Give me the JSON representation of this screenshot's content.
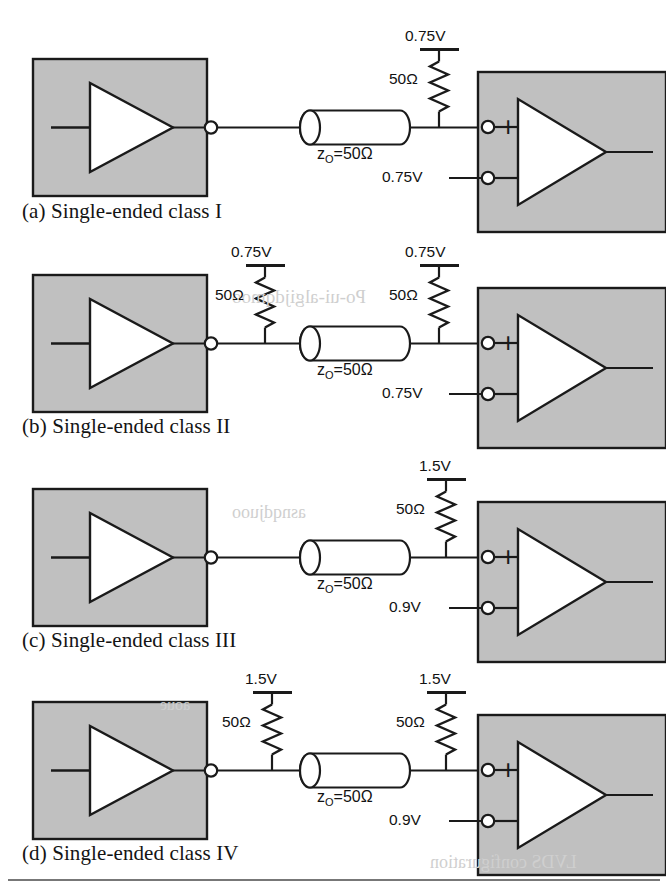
{
  "figure": {
    "title_alt": "Single-ended signaling classes I through IV",
    "colors": {
      "chip_fill": "#c0c0c0",
      "line": "#1a1a1a",
      "white": "#ffffff",
      "rule": "#4a4a4a"
    }
  },
  "common": {
    "line_impedance": "z",
    "line_impedance_sub": "O",
    "line_impedance_value": "=50Ω",
    "resistor_value": "50Ω",
    "plus_sign": "+",
    "minus_sign": "−"
  },
  "rows": [
    {
      "id": "a",
      "caption": "(a) Single-ended class I",
      "source_termination": null,
      "far_termination": {
        "supply": "0.75V",
        "resistor": "50Ω"
      },
      "reference_voltage": "0.75V",
      "line_label": "=50Ω"
    },
    {
      "id": "b",
      "caption": "(b) Single-ended class II",
      "source_termination": {
        "supply": "0.75V",
        "resistor": "50Ω"
      },
      "far_termination": {
        "supply": "0.75V",
        "resistor": "50Ω"
      },
      "reference_voltage": "0.75V",
      "line_label": "=50Ω"
    },
    {
      "id": "c",
      "caption": "(c) Single-ended class III",
      "source_termination": null,
      "far_termination": {
        "supply": "1.5V",
        "resistor": "50Ω"
      },
      "reference_voltage": "0.9V",
      "line_label": "=50Ω"
    },
    {
      "id": "d",
      "caption": "(d) Single-ended class IV",
      "source_termination": {
        "supply": "1.5V",
        "resistor": "50Ω"
      },
      "far_termination": {
        "supply": "1.5V",
        "resistor": "50Ω"
      },
      "reference_voltage": "0.9V",
      "line_label": "=50Ω"
    }
  ],
  "bleed_through": [
    {
      "text": "Po-ui-algijdqmoo",
      "x": 232,
      "y": 296,
      "size": 19
    },
    {
      "text": "asnqdjuoo",
      "x": 232,
      "y": 512,
      "size": 18
    },
    {
      "text": "LVDS configuration",
      "x": 430,
      "y": 862,
      "size": 18
    },
    {
      "text": "aoue",
      "x": 160,
      "y": 706,
      "size": 16
    }
  ]
}
